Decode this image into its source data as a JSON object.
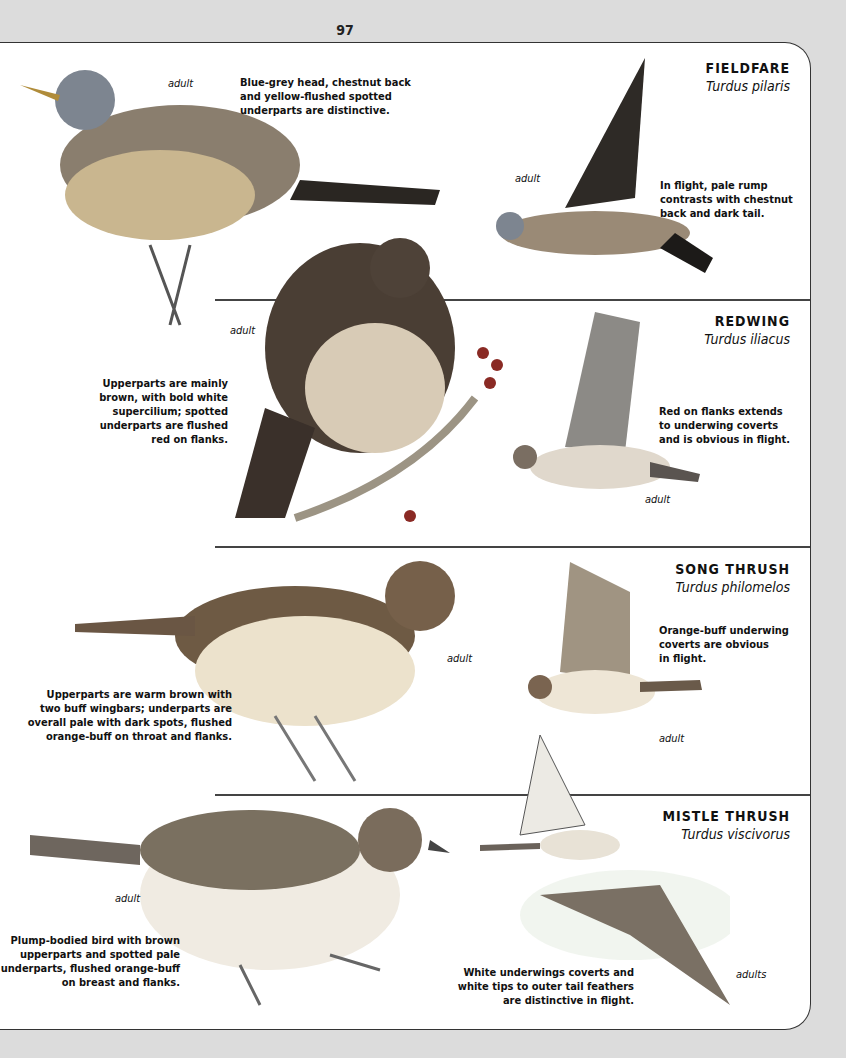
{
  "page": {
    "number": "97"
  },
  "species": [
    {
      "name": "FIELDFARE",
      "latin": "Turdus pilaris",
      "perched_label": "adult",
      "perched_desc": [
        "Blue-grey head, chestnut back",
        "and yellow-flushed spotted",
        "underparts are distinctive."
      ],
      "flight_label": "adult",
      "flight_desc": [
        "In flight, pale rump",
        "contrasts with chestnut",
        "back and dark tail."
      ]
    },
    {
      "name": "REDWING",
      "latin": "Turdus iliacus",
      "perched_label": "adult",
      "perched_desc": [
        "Upperparts are mainly",
        "brown, with bold white",
        "supercilium; spotted",
        "underparts are flushed",
        "red on flanks."
      ],
      "flight_label": "adult",
      "flight_desc": [
        "Red on flanks extends",
        "to underwing coverts",
        "and is obvious in flight."
      ]
    },
    {
      "name": "SONG THRUSH",
      "latin": "Turdus philomelos",
      "perched_label": "adult",
      "perched_desc": [
        "Upperparts are warm brown with",
        "two buff wingbars; underparts are",
        "overall pale with dark spots, flushed",
        "orange-buff on throat and flanks."
      ],
      "flight_label": "adult",
      "flight_desc": [
        "Orange-buff underwing",
        "coverts are obvious",
        "in flight."
      ]
    },
    {
      "name": "MISTLE THRUSH",
      "latin": "Turdus viscivorus",
      "perched_label": "adult",
      "perched_desc": [
        "Plump-bodied bird with brown",
        "upperparts and spotted pale",
        "underparts, flushed orange-buff",
        "on breast and flanks."
      ],
      "flight_label": "adults",
      "flight_desc": [
        "White underwings coverts and",
        "white tips to outer tail feathers",
        "are distinctive in flight."
      ]
    }
  ]
}
